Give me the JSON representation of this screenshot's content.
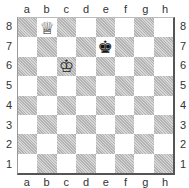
{
  "board": {
    "files": [
      "a",
      "b",
      "c",
      "d",
      "e",
      "f",
      "g",
      "h"
    ],
    "ranks": [
      "8",
      "7",
      "6",
      "5",
      "4",
      "3",
      "2",
      "1"
    ],
    "colors": {
      "light": "#ffffff",
      "dark": "#c8c8c8",
      "border": "#555555"
    },
    "pieces": [
      {
        "square": "b8",
        "type": "queen",
        "color": "white",
        "glyph": "♕"
      },
      {
        "square": "c6",
        "type": "king",
        "color": "white",
        "glyph": "♔"
      },
      {
        "square": "e7",
        "type": "king",
        "color": "black",
        "glyph": "♚"
      }
    ]
  }
}
